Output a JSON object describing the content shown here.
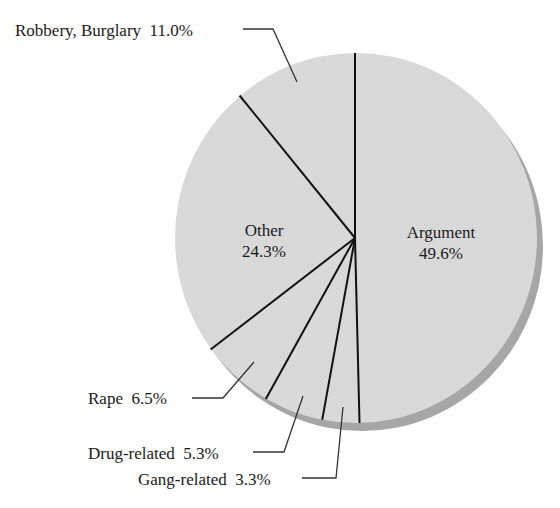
{
  "chart_data": {
    "type": "pie",
    "title": "",
    "start_angle_deg": 0,
    "direction": "clockwise",
    "slices": [
      {
        "label": "Argument",
        "value": 49.6,
        "display": "49.6%",
        "label_position": "inside"
      },
      {
        "label": "Gang-related",
        "value": 3.3,
        "display": "3.3%",
        "label_position": "outside"
      },
      {
        "label": "Drug-related",
        "value": 5.3,
        "display": "5.3%",
        "label_position": "outside"
      },
      {
        "label": "Rape",
        "value": 6.5,
        "display": "6.5%",
        "label_position": "outside"
      },
      {
        "label": "Other",
        "value": 24.3,
        "display": "24.3%",
        "label_position": "inside"
      },
      {
        "label": "Robbery, Burglary",
        "value": 11.0,
        "display": "11.0%",
        "label_position": "outside"
      }
    ],
    "colors": {
      "fill": "#d8d8d8",
      "shadow": "#a6a6a6",
      "divider": "#111111"
    }
  },
  "labels": {
    "argument": {
      "name": "Argument",
      "pct": "49.6%"
    },
    "other": {
      "name": "Other",
      "pct": "24.3%"
    },
    "robbery": "Robbery, Burglary  11.0%",
    "rape": "Rape  6.5%",
    "drug": "Drug-related  5.3%",
    "gang": "Gang-related  3.3%"
  }
}
